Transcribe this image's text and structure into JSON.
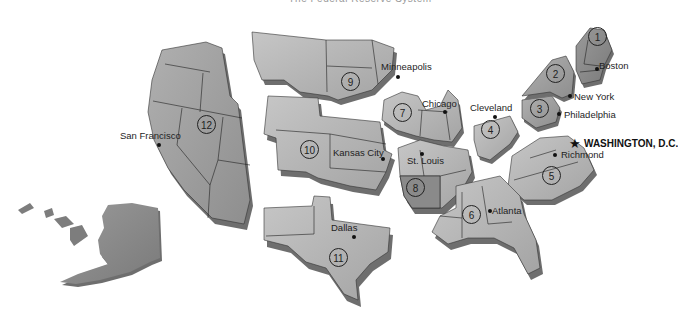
{
  "map": {
    "title_partial": "The Federal Reserve System",
    "districts": [
      {
        "number": "1",
        "city": "Boston"
      },
      {
        "number": "2",
        "city": "New York"
      },
      {
        "number": "3",
        "city": "Philadelphia"
      },
      {
        "number": "4",
        "city": "Cleveland"
      },
      {
        "number": "5",
        "city": "Richmond"
      },
      {
        "number": "6",
        "city": "Atlanta"
      },
      {
        "number": "7",
        "city": "Chicago"
      },
      {
        "number": "8",
        "city": "St. Louis"
      },
      {
        "number": "9",
        "city": "Minneapolis"
      },
      {
        "number": "10",
        "city": "Kansas City"
      },
      {
        "number": "11",
        "city": "Dallas"
      },
      {
        "number": "12",
        "city": "San Francisco"
      }
    ],
    "capital": {
      "label": "WASHINGTON, D.C.",
      "icon": "star-icon"
    },
    "colors": {
      "district_light": "#b9b9b9",
      "district_mid": "#a3a3a3",
      "district_dark": "#8a8a8a",
      "shadow": "#6e6e6e",
      "border": "#2a2a2a"
    }
  }
}
